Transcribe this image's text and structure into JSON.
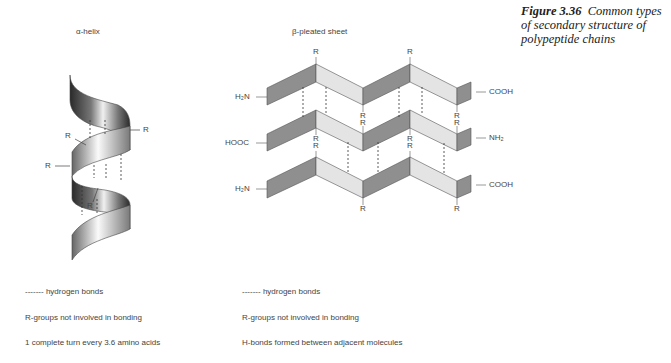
{
  "figure": {
    "number": "Figure 3.36",
    "caption": "Common types of secondary structure of polypeptide chains"
  },
  "alpha_helix": {
    "title": "α-helix",
    "r_labels": [
      "R",
      "R",
      "R",
      "R"
    ],
    "legend": {
      "dash_sample": "-------",
      "hydrogen_bonds": "hydrogen bonds",
      "line2": "R-groups not involved in bonding",
      "line3": "1 complete turn every 3.6 amino acids"
    }
  },
  "beta_sheet": {
    "title": "β-pleated sheet",
    "strands": [
      {
        "left": "H₂N",
        "right": "COOH"
      },
      {
        "left": "HOOC",
        "right": "NH₂"
      },
      {
        "left": "H₂N",
        "right": "COOH"
      }
    ],
    "r_label": "R",
    "legend": {
      "dash_sample": "-------",
      "hydrogen_bonds": "hydrogen bonds",
      "line2": "R-groups not involved in bonding",
      "line3": "H-bonds formed between adjacent molecules"
    }
  },
  "colors": {
    "dark_face": "#8f8f8f",
    "light_face": "#e4e4e4",
    "outline": "#555555",
    "text": "#444444"
  }
}
